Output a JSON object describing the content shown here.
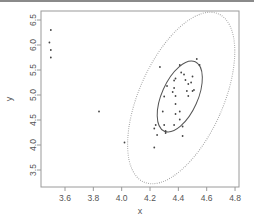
{
  "chart_data": {
    "type": "scatter",
    "title": "",
    "xlabel": "x",
    "ylabel": "y",
    "xlim": [
      3.45,
      4.83
    ],
    "ylim": [
      3.17,
      6.68
    ],
    "x_ticks": [
      3.6,
      3.8,
      4.0,
      4.2,
      4.4,
      4.6,
      4.8
    ],
    "x_tick_labels": [
      "3.6",
      "3.8",
      "4.0",
      "4.2",
      "4.4",
      "4.6",
      "4.8"
    ],
    "y_ticks": [
      3.5,
      4.0,
      4.5,
      5.0,
      5.5,
      6.0,
      6.5
    ],
    "y_tick_labels": [
      "3.5",
      "4.0",
      "4.5",
      "5.0",
      "5.5",
      "6.0",
      "6.5"
    ],
    "grid": false,
    "legend": null,
    "series": [
      {
        "name": "points",
        "marker": "dot",
        "color": "#444444",
        "points": [
          [
            3.5,
            6.3
          ],
          [
            3.49,
            6.05
          ],
          [
            3.5,
            5.9
          ],
          [
            3.5,
            5.75
          ],
          [
            3.84,
            4.67
          ],
          [
            4.02,
            4.05
          ],
          [
            4.27,
            5.56
          ],
          [
            4.24,
            4.4
          ],
          [
            4.23,
            4.33
          ],
          [
            4.23,
            3.95
          ],
          [
            4.25,
            4.2
          ],
          [
            4.3,
            4.97
          ],
          [
            4.29,
            4.67
          ],
          [
            4.31,
            4.28
          ],
          [
            4.31,
            4.24
          ],
          [
            4.32,
            5.18
          ],
          [
            4.3,
            4.4
          ],
          [
            4.37,
            5.29
          ],
          [
            4.37,
            5.14
          ],
          [
            4.36,
            5.06
          ],
          [
            4.38,
            5.33
          ],
          [
            4.38,
            4.98
          ],
          [
            4.38,
            4.82
          ],
          [
            4.38,
            4.62
          ],
          [
            4.37,
            4.4
          ],
          [
            4.41,
            4.67
          ],
          [
            4.41,
            4.51
          ],
          [
            4.41,
            5.6
          ],
          [
            4.42,
            5.45
          ],
          [
            4.44,
            5.41
          ],
          [
            4.45,
            5.3
          ],
          [
            4.46,
            5.08
          ],
          [
            4.47,
            5.22
          ],
          [
            4.47,
            4.98
          ],
          [
            4.49,
            5.25
          ],
          [
            4.5,
            5.37
          ],
          [
            4.51,
            5.1
          ],
          [
            4.5,
            5.08
          ],
          [
            4.53,
            5.72
          ],
          [
            4.55,
            5.6
          ],
          [
            4.43,
            4.18
          ],
          [
            4.43,
            4.37
          ]
        ]
      }
    ],
    "ellipses": [
      {
        "name": "inner-ellipse",
        "style": "solid",
        "color": "#555555",
        "center": [
          4.41,
          4.97
        ],
        "rx_px": 18,
        "ry_px": 38,
        "rotation_deg": 24
      },
      {
        "name": "outer-ellipse",
        "style": "dotted",
        "color": "#9a9a9a",
        "center": [
          4.42,
          4.94
        ],
        "rx_px": 42,
        "ry_px": 92,
        "rotation_deg": 24
      }
    ]
  }
}
